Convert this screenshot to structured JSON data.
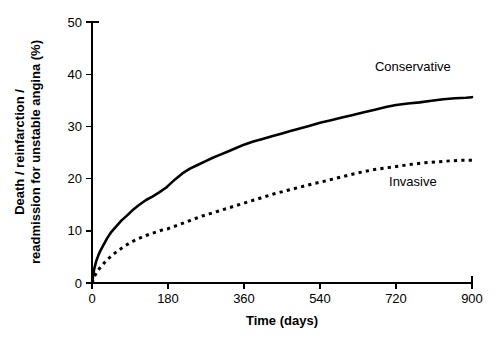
{
  "chart_data": {
    "type": "line",
    "title": "",
    "xlabel": "Time (days)",
    "ylabel": "Death / reinfarction / readmission for unstable angina (%)",
    "ylabel_line1": "Death / reinfarction /",
    "ylabel_line2": "readmission for unstable angina (%)",
    "xlim": [
      0,
      900
    ],
    "ylim": [
      0,
      50
    ],
    "xticks": [
      0,
      180,
      360,
      540,
      720,
      900
    ],
    "xtick_labels": [
      "0",
      "180",
      "360",
      "540",
      "720",
      "900"
    ],
    "yticks": [
      0,
      10,
      20,
      30,
      40,
      50
    ],
    "ytick_labels": [
      "0",
      "10",
      "20",
      "30",
      "40",
      "50"
    ],
    "grid": false,
    "legend_position": "inline-right",
    "colors": {
      "line": "#000000",
      "background": "#ffffff"
    },
    "series": [
      {
        "name": "Conservative",
        "style": "solid",
        "label_x": 760,
        "label_y": 41.5,
        "x": [
          0,
          5,
          10,
          15,
          20,
          28,
          36,
          46,
          58,
          70,
          84,
          98,
          112,
          128,
          144,
          160,
          176,
          180,
          196,
          214,
          232,
          250,
          268,
          286,
          304,
          322,
          340,
          360,
          382,
          404,
          426,
          448,
          470,
          492,
          514,
          540,
          566,
          592,
          618,
          644,
          670,
          696,
          720,
          748,
          776,
          804,
          832,
          860,
          886,
          900
        ],
        "y": [
          0,
          2.6,
          4.2,
          5.3,
          6.2,
          7.4,
          8.6,
          9.8,
          10.9,
          12.0,
          13.0,
          14.1,
          15.0,
          15.9,
          16.6,
          17.4,
          18.3,
          18.6,
          19.8,
          21.0,
          21.9,
          22.6,
          23.3,
          24.0,
          24.6,
          25.2,
          25.8,
          26.5,
          27.1,
          27.6,
          28.1,
          28.6,
          29.1,
          29.6,
          30.1,
          30.7,
          31.2,
          31.7,
          32.2,
          32.7,
          33.2,
          33.7,
          34.1,
          34.4,
          34.6,
          34.9,
          35.2,
          35.4,
          35.5,
          35.6
        ]
      },
      {
        "name": "Invasive",
        "style": "dotted",
        "label_x": 760,
        "label_y": 19.5,
        "x": [
          0,
          6,
          14,
          24,
          34,
          46,
          60,
          76,
          92,
          110,
          128,
          146,
          164,
          180,
          200,
          220,
          240,
          260,
          280,
          300,
          320,
          340,
          360,
          384,
          408,
          432,
          456,
          480,
          504,
          528,
          540,
          570,
          600,
          630,
          660,
          690,
          720,
          752,
          784,
          816,
          848,
          876,
          900
        ],
        "y": [
          0,
          1.3,
          2.4,
          3.4,
          4.3,
          5.2,
          6.1,
          7.0,
          7.8,
          8.5,
          9.1,
          9.6,
          10.1,
          10.4,
          11.0,
          11.6,
          12.2,
          12.8,
          13.3,
          13.8,
          14.3,
          14.8,
          15.3,
          15.9,
          16.5,
          17.1,
          17.6,
          18.1,
          18.6,
          19.1,
          19.3,
          19.9,
          20.5,
          21.1,
          21.6,
          22.0,
          22.3,
          22.7,
          23.0,
          23.2,
          23.4,
          23.5,
          23.5
        ]
      }
    ]
  }
}
